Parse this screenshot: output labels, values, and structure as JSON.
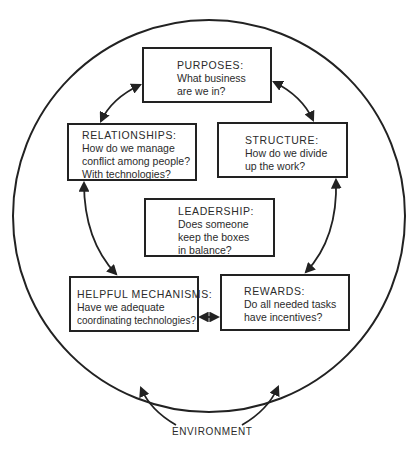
{
  "diagram": {
    "boxes": {
      "purposes": {
        "title": "PURPOSES:",
        "lines": [
          "What business",
          "are we in?"
        ]
      },
      "relationships": {
        "title": "RELATIONSHIPS:",
        "lines": [
          "How do we manage",
          "conflict among people?",
          "With technologies?"
        ]
      },
      "structure": {
        "title": "STRUCTURE:",
        "lines": [
          "How do we divide",
          "up the work?"
        ]
      },
      "leadership": {
        "title": "LEADERSHIP:",
        "lines": [
          "Does someone",
          "keep the boxes",
          "in balance?"
        ]
      },
      "helpful_mechanisms": {
        "title": "HELPFUL MECHANISMS:",
        "lines": [
          "Have we adequate",
          "coordinating technologies?"
        ]
      },
      "rewards": {
        "title": "REWARDS:",
        "lines": [
          "Do all needed tasks",
          "have incentives?"
        ]
      }
    },
    "environment_label": "ENVIRONMENT",
    "connections": [
      {
        "from": "purposes",
        "to": "relationships",
        "type": "double-arrow"
      },
      {
        "from": "purposes",
        "to": "structure",
        "type": "double-arrow"
      },
      {
        "from": "relationships",
        "to": "helpful_mechanisms",
        "type": "double-arrow"
      },
      {
        "from": "structure",
        "to": "rewards",
        "type": "double-arrow"
      },
      {
        "from": "helpful_mechanisms",
        "to": "rewards",
        "type": "double-arrow"
      },
      {
        "from": "environment",
        "to": "organization",
        "type": "arrow"
      }
    ],
    "colors": {
      "stroke": "#222222",
      "text": "#2b2b2b",
      "background": "#ffffff"
    }
  }
}
